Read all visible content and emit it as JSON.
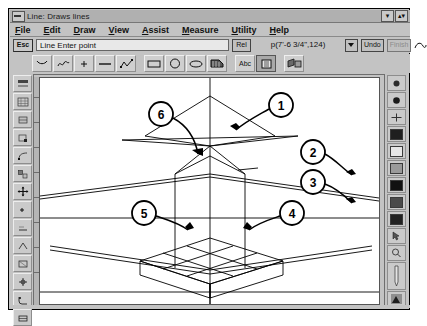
{
  "window": {
    "title": "Line: Draws lines",
    "system_menu_icon": "system-menu-icon",
    "minimize_label": "▾",
    "maximize_label": "▴▾"
  },
  "menubar": {
    "items": [
      {
        "label": "File",
        "accel": "F"
      },
      {
        "label": "Edit",
        "accel": "E"
      },
      {
        "label": "Draw",
        "accel": "D"
      },
      {
        "label": "View",
        "accel": "V"
      },
      {
        "label": "Assist",
        "accel": "A"
      },
      {
        "label": "Measure",
        "accel": "M"
      },
      {
        "label": "Utility",
        "accel": "U"
      },
      {
        "label": "Help",
        "accel": "H"
      }
    ]
  },
  "commandbar": {
    "esc_label": "Esc",
    "prompt": "Line  Enter point",
    "rel_label": "Rel",
    "coordinate": "p(7'-6 3/4\",124)",
    "undo_label": "Undo",
    "finish_label": "Finish",
    "dropdown_icon": "chevron-down-icon",
    "curve_icon": "freehand-curve-icon"
  },
  "toolbar": {
    "items": [
      {
        "name": "arc-tool",
        "glyph": "arc-icon"
      },
      {
        "name": "spline-tool",
        "glyph": "spline-icon"
      },
      {
        "name": "point-tool",
        "glyph": "point-icon"
      },
      {
        "name": "line-tool",
        "glyph": "line-icon"
      },
      {
        "name": "polyline-tool",
        "glyph": "polyline-icon"
      },
      {
        "name": "rectangle-tool",
        "glyph": "rectangle-icon"
      },
      {
        "name": "circle-tool",
        "glyph": "circle-icon"
      },
      {
        "name": "ellipse-tool",
        "glyph": "ellipse-icon"
      },
      {
        "name": "hatch-tool",
        "glyph": "hatch-icon"
      },
      {
        "name": "text-tool",
        "glyph": "Abc"
      },
      {
        "name": "dimension-tool",
        "glyph": "dimension-icon"
      },
      {
        "name": "render-tool",
        "glyph": "render-icon"
      }
    ]
  },
  "left_palette": {
    "items": [
      {
        "name": "select-tool",
        "glyph": "select-icon"
      },
      {
        "name": "grid-tool",
        "glyph": "grid-icon"
      },
      {
        "name": "snap-tool",
        "glyph": "snap-icon"
      },
      {
        "name": "endpoint-snap-tool",
        "glyph": "endpoint-icon"
      },
      {
        "name": "midpoint-snap-tool",
        "glyph": "midpoint-icon"
      },
      {
        "name": "intersection-snap-tool",
        "glyph": "intersection-icon"
      },
      {
        "name": "move-tool",
        "glyph": "move-icon"
      },
      {
        "name": "copy-tool",
        "glyph": "copy-icon"
      },
      {
        "name": "rotate-tool",
        "glyph": "rotate-icon"
      },
      {
        "name": "mirror-tool",
        "glyph": "mirror-icon"
      },
      {
        "name": "scale-tool",
        "glyph": "scale-icon"
      },
      {
        "name": "trim-tool",
        "glyph": "trim-icon"
      },
      {
        "name": "fillet-tool",
        "glyph": "fillet-icon"
      },
      {
        "name": "erase-tool",
        "glyph": "erase-icon"
      }
    ]
  },
  "right_palette": {
    "items": [
      {
        "name": "line-weight-1",
        "color": "#2b2b2b",
        "glyph": "dot-icon"
      },
      {
        "name": "line-weight-2",
        "color": "#1a1a1a",
        "glyph": "dot-icon"
      },
      {
        "name": "layer-grid",
        "color": "#d6d6d6",
        "glyph": "grid-icon"
      },
      {
        "name": "fill-pattern-solid",
        "color": "#1f1f1f",
        "glyph": "swatch"
      },
      {
        "name": "fill-pattern-light",
        "color": "#e6e6e6",
        "glyph": "swatch"
      },
      {
        "name": "fill-pattern-medium",
        "color": "#9a9a9a",
        "glyph": "swatch"
      },
      {
        "name": "color-black",
        "color": "#111111",
        "glyph": "swatch"
      },
      {
        "name": "color-dark-gray",
        "color": "#4a4a4a",
        "glyph": "swatch"
      },
      {
        "name": "color-darker",
        "color": "#222222",
        "glyph": "swatch"
      },
      {
        "name": "smart-cursor",
        "color": "#cccccc",
        "glyph": "cursor-icon"
      },
      {
        "name": "zoom-tool",
        "color": "#cccccc",
        "glyph": "magnifier-icon"
      },
      {
        "name": "pen-tool",
        "color": "#cccccc",
        "glyph": "pen-icon"
      },
      {
        "name": "mountain-view",
        "color": "#555555",
        "glyph": "mountain-icon"
      }
    ]
  },
  "drawing": {
    "description": "3D wireframe roof/pyramid construction over a gridded slab",
    "callouts": [
      {
        "id": "1",
        "label": "1",
        "cx": 281,
        "cy": 95
      },
      {
        "id": "2",
        "label": "2",
        "cx": 313,
        "cy": 142
      },
      {
        "id": "3",
        "label": "3",
        "cx": 313,
        "cy": 172
      },
      {
        "id": "4",
        "label": "4",
        "cx": 292,
        "cy": 203
      },
      {
        "id": "5",
        "label": "5",
        "cx": 144,
        "cy": 203
      },
      {
        "id": "6",
        "label": "6",
        "cx": 161,
        "cy": 104
      }
    ],
    "line_color": "#000000",
    "canvas_background": "#ffffff"
  }
}
